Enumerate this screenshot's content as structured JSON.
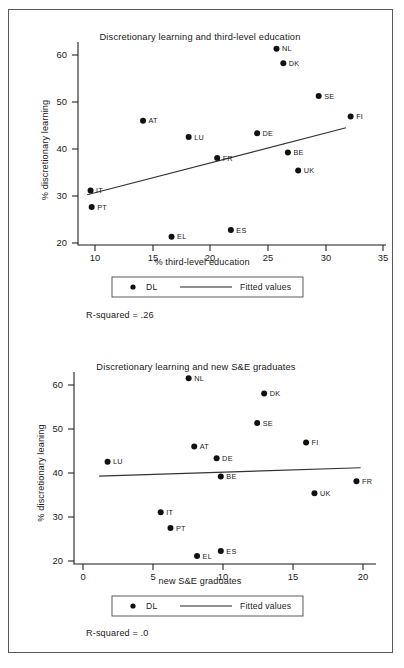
{
  "page": {
    "background_color": "#ffffff",
    "border_color": "#5a5a5a"
  },
  "chart_data": [
    {
      "id": "chart-top",
      "type": "scatter",
      "title": "Discretionary learning and third-level education",
      "xlabel": "% third-level education",
      "ylabel": "% discretionary learning",
      "xlim": [
        8.5,
        35.5
      ],
      "ylim": [
        17.0,
        65.5
      ],
      "xticks": [
        10,
        15,
        20,
        25,
        30,
        35
      ],
      "xticklabels": [
        "10",
        "15",
        "20",
        "25",
        "30",
        "35"
      ],
      "yticks": [
        20,
        30,
        40,
        50,
        60
      ],
      "yticklabels": [
        "20",
        "30",
        "40",
        "50",
        "60"
      ],
      "grid": false,
      "legend_position": "below-axes",
      "legend": [
        {
          "marker": "dot",
          "label": "DL"
        },
        {
          "marker": "line",
          "label": "Fitted values"
        }
      ],
      "annotation": "R-squared = .26",
      "points": [
        {
          "label": "NL",
          "x": 25.9,
          "y": 63.9
        },
        {
          "label": "DK",
          "x": 26.5,
          "y": 60.4
        },
        {
          "label": "SE",
          "x": 29.6,
          "y": 52.6
        },
        {
          "label": "FI",
          "x": 32.4,
          "y": 47.7
        },
        {
          "label": "AT",
          "x": 14.2,
          "y": 46.7
        },
        {
          "label": "LU",
          "x": 18.2,
          "y": 42.8
        },
        {
          "label": "DE",
          "x": 24.2,
          "y": 43.7
        },
        {
          "label": "BE",
          "x": 26.9,
          "y": 39.1
        },
        {
          "label": "FR",
          "x": 20.7,
          "y": 37.8
        },
        {
          "label": "UK",
          "x": 27.8,
          "y": 34.8
        },
        {
          "label": "IT",
          "x": 9.6,
          "y": 30.0
        },
        {
          "label": "PT",
          "x": 9.7,
          "y": 26.1
        },
        {
          "label": "ES",
          "x": 21.9,
          "y": 20.6
        },
        {
          "label": "EL",
          "x": 16.7,
          "y": 19.0
        }
      ],
      "fit_line": {
        "x0": 9.3,
        "y0": 29.0,
        "x1": 32.0,
        "y1": 45.0
      }
    },
    {
      "id": "chart-bottom",
      "type": "scatter",
      "title": "Discretionary learning and new S&E graduates",
      "xlabel": "new S&E graduates",
      "ylabel": "% discretionary leaning",
      "xlim": [
        -0.6,
        21.0
      ],
      "ylim": [
        17.0,
        65.5
      ],
      "xticks": [
        0,
        5,
        10,
        15,
        20
      ],
      "xticklabels": [
        "0",
        "5",
        "10",
        "15",
        "20"
      ],
      "yticks": [
        20,
        30,
        40,
        50,
        60
      ],
      "yticklabels": [
        "20",
        "30",
        "40",
        "50",
        "60"
      ],
      "grid": false,
      "legend_position": "below-axes",
      "legend": [
        {
          "marker": "dot",
          "label": "DL"
        },
        {
          "marker": "line",
          "label": "Fitted values"
        }
      ],
      "annotation": "R-squared = .0",
      "points": [
        {
          "label": "NL",
          "x": 7.6,
          "y": 63.9
        },
        {
          "label": "DK",
          "x": 13.0,
          "y": 60.1
        },
        {
          "label": "SE",
          "x": 12.5,
          "y": 52.6
        },
        {
          "label": "FI",
          "x": 16.0,
          "y": 47.7
        },
        {
          "label": "AT",
          "x": 8.0,
          "y": 46.7
        },
        {
          "label": "DE",
          "x": 9.6,
          "y": 43.7
        },
        {
          "label": "LU",
          "x": 1.8,
          "y": 42.8
        },
        {
          "label": "BE",
          "x": 9.9,
          "y": 39.1
        },
        {
          "label": "FR",
          "x": 19.6,
          "y": 37.9
        },
        {
          "label": "UK",
          "x": 16.6,
          "y": 34.9
        },
        {
          "label": "IT",
          "x": 5.6,
          "y": 30.1
        },
        {
          "label": "PT",
          "x": 6.3,
          "y": 26.1
        },
        {
          "label": "ES",
          "x": 9.9,
          "y": 20.3
        },
        {
          "label": "EL",
          "x": 8.2,
          "y": 19.0
        }
      ],
      "fit_line": {
        "x0": 1.2,
        "y0": 39.2,
        "x1": 19.9,
        "y1": 41.3
      }
    }
  ]
}
